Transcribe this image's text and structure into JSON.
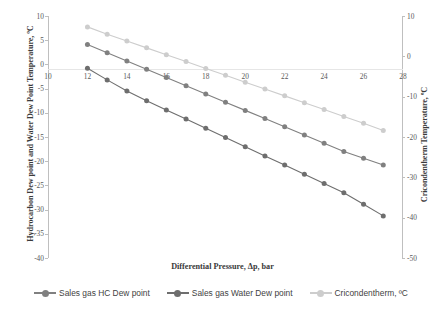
{
  "chart_data": {
    "type": "line",
    "title": "",
    "xlabel": "Differential Pressure, Δp,  bar",
    "ylabel": "Hydrocarbon Dew point and Water Dew Point Temperature, ºC",
    "y2label": "Cricondentherm Temperature, ºC",
    "xlim": [
      10,
      28
    ],
    "ylim": [
      -40,
      10
    ],
    "y2lim": [
      -50,
      10
    ],
    "xticks": [
      10,
      12,
      14,
      16,
      18,
      20,
      22,
      24,
      26,
      28
    ],
    "yticks": [
      10,
      5,
      0,
      -5,
      -10,
      -15,
      -20,
      -25,
      -30,
      -35,
      -40
    ],
    "y2ticks": [
      10,
      0,
      -10,
      -20,
      -30,
      -40,
      -50
    ],
    "grid": false,
    "legend_position": "bottom",
    "x": [
      12,
      13,
      14,
      15,
      16,
      17,
      18,
      19,
      20,
      21,
      22,
      23,
      24,
      25,
      26,
      27
    ],
    "series": [
      {
        "name": "Sales gas HC Dew point",
        "axis": "left",
        "color": "#808080",
        "marker": "circle",
        "values": [
          4.1,
          2.4,
          0.7,
          -1.0,
          -2.7,
          -4.4,
          -6.1,
          -7.8,
          -9.5,
          -11.2,
          -12.9,
          -14.6,
          -16.3,
          -18.0,
          -19.4,
          -20.8
        ]
      },
      {
        "name": "Sales gas Water Dew point",
        "axis": "left",
        "color": "#6e6e6e",
        "marker": "circle",
        "values": [
          -0.8,
          -3.2,
          -5.5,
          -7.5,
          -9.4,
          -11.3,
          -13.2,
          -15.1,
          -17.0,
          -18.9,
          -20.8,
          -22.7,
          -24.6,
          -26.5,
          -28.9,
          -31.3
        ]
      },
      {
        "name": "Cricondentherm, ºC",
        "axis": "right",
        "color": "#cdcdcd",
        "marker": "circle",
        "values": [
          7.3,
          5.5,
          3.8,
          2.1,
          0.4,
          -1.3,
          -3.0,
          -4.7,
          -6.4,
          -8.1,
          -9.8,
          -11.5,
          -13.2,
          -14.9,
          -16.6,
          -18.4
        ]
      }
    ],
    "legend": [
      {
        "label": "Sales gas HC Dew point",
        "color": "#808080"
      },
      {
        "label": "Sales gas Water Dew point",
        "color": "#6e6e6e"
      },
      {
        "label": "Cricondentherm, ºC",
        "color": "#cdcdcd"
      }
    ]
  }
}
